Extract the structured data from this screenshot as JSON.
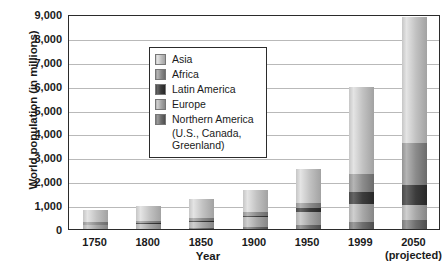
{
  "chart_data": {
    "type": "bar",
    "subtype": "stacked-bar",
    "title": "",
    "xlabel": "Year",
    "ylabel": "World population (in millions)",
    "categories": [
      "1750",
      "1800",
      "1850",
      "1900",
      "1950",
      "1999",
      "2050"
    ],
    "category_sublabels": [
      "",
      "",
      "",
      "",
      "",
      "",
      "(projected)"
    ],
    "ylim": [
      0,
      9000
    ],
    "ytick_labels": [
      "0",
      "1,000",
      "2,000",
      "3,000",
      "4,000",
      "5,000",
      "6,000",
      "7,000",
      "8,000",
      "9,000"
    ],
    "ytick_values": [
      0,
      1000,
      2000,
      3000,
      4000,
      5000,
      6000,
      7000,
      8000,
      9000
    ],
    "grid": true,
    "grid_axis": "y",
    "legend_position": "upper-left-inside",
    "stack_order_bottom_to_top": [
      "Northern America",
      "Europe",
      "Latin America",
      "Africa",
      "Asia"
    ],
    "series": [
      {
        "name": "Northern America",
        "color": "#6e6e6e",
        "values": [
          2,
          7,
          26,
          82,
          172,
          307,
          392
        ]
      },
      {
        "name": "Europe",
        "color": "#b9b9b9",
        "values": [
          163,
          203,
          276,
          408,
          547,
          729,
          628
        ]
      },
      {
        "name": "Latin America",
        "color": "#3c3c3c",
        "values": [
          16,
          24,
          38,
          74,
          167,
          511,
          809
        ]
      },
      {
        "name": "Africa",
        "color": "#8c8c8c",
        "values": [
          106,
          107,
          111,
          133,
          221,
          767,
          1766
        ]
      },
      {
        "name": "Asia",
        "color": "#c9c9c9",
        "values": [
          502,
          635,
          809,
          947,
          1402,
          3634,
          5268
        ]
      }
    ],
    "totals": [
      791,
      978,
      1262,
      1650,
      2521,
      5978,
      8909
    ]
  },
  "legend": {
    "items": [
      {
        "label": "Asia",
        "swatch": "legend-swatch-asia"
      },
      {
        "label": "Africa",
        "swatch": "legend-swatch-africa"
      },
      {
        "label": "Latin America",
        "swatch": "legend-swatch-latin-america"
      },
      {
        "label": "Europe",
        "swatch": "legend-swatch-europe"
      },
      {
        "label": "Northern America",
        "swatch": "legend-swatch-northern-america"
      }
    ],
    "continuation_line_1": "(U.S., Canada,",
    "continuation_line_2": "Greenland)"
  }
}
